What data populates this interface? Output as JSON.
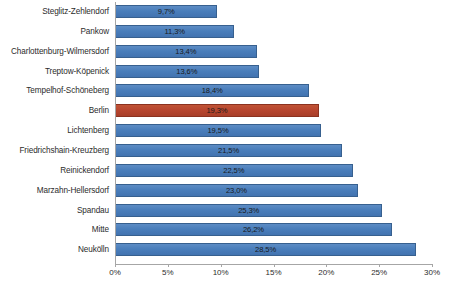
{
  "chart_data": {
    "type": "bar",
    "orientation": "horizontal",
    "title": "",
    "subtitle": "",
    "xlabel": "",
    "ylabel": "",
    "xlim": [
      0,
      30
    ],
    "xticks": [
      "0%",
      "5%",
      "10%",
      "15%",
      "20%",
      "25%",
      "30%"
    ],
    "xtick_values": [
      0,
      5,
      10,
      15,
      20,
      25,
      30
    ],
    "grid": false,
    "legend": "none",
    "value_label_position": "inside-center",
    "decimal_separator": ",",
    "categories": [
      "Steglitz-Zehlendorf",
      "Pankow",
      "Charlottenburg-Wilmersdorf",
      "Treptow-Köpenick",
      "Tempelhof-Schöneberg",
      "Berlin",
      "Lichtenberg",
      "Friedrichshain-Kreuzberg",
      "Reinickendorf",
      "Marzahn-Hellersdorf",
      "Spandau",
      "Mitte",
      "Neukölln"
    ],
    "values": [
      9.7,
      11.3,
      13.4,
      13.6,
      18.4,
      19.3,
      19.5,
      21.5,
      22.5,
      23.0,
      25.3,
      26.2,
      28.5
    ],
    "value_labels": [
      "9,7%",
      "11,3%",
      "13,4%",
      "13,6%",
      "18,4%",
      "19,3%",
      "19,5%",
      "21,5%",
      "22,5%",
      "23,0%",
      "25,3%",
      "26,2%",
      "28,5%"
    ],
    "bar_colors": [
      "#4A7EBB",
      "#4A7EBB",
      "#4A7EBB",
      "#4A7EBB",
      "#4A7EBB",
      "#B8462F",
      "#4A7EBB",
      "#4A7EBB",
      "#4A7EBB",
      "#4A7EBB",
      "#4A7EBB",
      "#4A7EBB",
      "#4A7EBB"
    ],
    "highlight_category": "Berlin",
    "colors": {
      "series": "#4A7EBB",
      "highlight": "#B8462F",
      "axis": "#A6A6A6",
      "text": "#2C2C2C",
      "background": "#FFFFFF"
    }
  }
}
